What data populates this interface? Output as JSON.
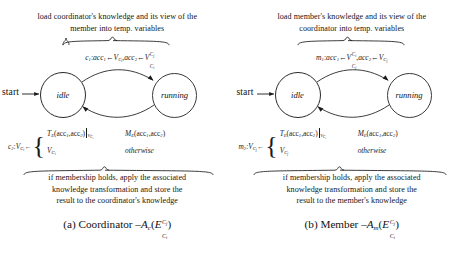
{
  "figure": {
    "type": "state-machine-diagram-pair",
    "panels": [
      {
        "id": "coordinator",
        "top_note_line1": "load coordinator's knowledge and its view of the",
        "top_note_line2": "member into temp. variables",
        "bottom_note_line1": "if membership holds, apply the associated",
        "bottom_note_line2": "knowledge transformation and store the",
        "bottom_note_line3": "result to the coordinator's knowledge",
        "start_label": "start",
        "states": [
          {
            "name": "idle",
            "emphasis": "thick"
          },
          {
            "name": "running",
            "emphasis": "thin"
          }
        ],
        "transition_forward": {
          "guard_name": "c",
          "guard_index": "1",
          "assign1_var": "acc",
          "assign1_sub": "1",
          "assign1_value_base": "V",
          "assign1_value_sub": "C",
          "assign1_value_subsub": "i",
          "assign2_var": "acc",
          "assign2_sub": "2",
          "assign2_value_base": "V",
          "assign2_value_sup": "C",
          "assign2_value_supsub": "j",
          "assign2_value_sub": "C",
          "assign2_value_subsub": "i"
        },
        "transition_back": {
          "guard_name": "c",
          "guard_index": "2",
          "target_base": "V",
          "target_sub": "C",
          "target_subsub": "i",
          "case1_fn": "T",
          "case1_fn_sub": "E",
          "case1_args": "(acc",
          "case1_arg1_sub": "1",
          "case1_args_mid": ",acc",
          "case1_arg2_sub": "2",
          "case1_args_end": ")",
          "case1_restrict_base": "V",
          "case1_restrict_sub": "C",
          "case1_restrict_subsub": "i",
          "case1_cond_fn": "M",
          "case1_cond_fn_sub": "E",
          "case1_cond_args": "(acc",
          "case1_cond_arg1_sub": "1",
          "case1_cond_args_mid": ",acc",
          "case1_cond_arg2_sub": "2",
          "case1_cond_args_end": ")",
          "case2_value_base": "V",
          "case2_value_sub": "C",
          "case2_value_subsub": "i",
          "case2_cond": "otherwise"
        },
        "caption_prefix": "(a) Coordinator",
        "caption_dash": "–",
        "caption_fn": "A",
        "caption_fn_sub": "c",
        "caption_open": "(",
        "caption_arg": "E",
        "caption_arg_sup": "C",
        "caption_arg_supsub": "j",
        "caption_arg_sub": "C",
        "caption_arg_subsub": "i",
        "caption_close": ")"
      },
      {
        "id": "member",
        "top_note_line1": "load member's knowledge and its view of the",
        "top_note_line2": "coordinator into temp. variables",
        "bottom_note_line1": "if membership holds, apply the associated",
        "bottom_note_line2": "knowledge transformation and store the",
        "bottom_note_line3": "result to the member's knowledge",
        "start_label": "start",
        "states": [
          {
            "name": "idle",
            "emphasis": "thick"
          },
          {
            "name": "running",
            "emphasis": "thin"
          }
        ],
        "transition_forward": {
          "guard_name": "m",
          "guard_index": "1",
          "assign1_var": "acc",
          "assign1_sub": "1",
          "assign1_value_base": "V",
          "assign1_value_sup": "C",
          "assign1_value_supsub": "i",
          "assign1_value_sub": "C",
          "assign1_value_subsub": "j",
          "assign2_var": "acc",
          "assign2_sub": "2",
          "assign2_value_base": "V",
          "assign2_value_sub": "C",
          "assign2_value_subsub": "j"
        },
        "transition_back": {
          "guard_name": "m",
          "guard_index": "2",
          "target_base": "V",
          "target_sub": "C",
          "target_subsub": "j",
          "case1_fn": "T",
          "case1_fn_sub": "E",
          "case1_args": "(acc",
          "case1_arg1_sub": "1",
          "case1_args_mid": ",acc",
          "case1_arg2_sub": "2",
          "case1_args_end": ")",
          "case1_restrict_base": "V",
          "case1_restrict_sub": "C",
          "case1_restrict_subsub": "j",
          "case1_cond_fn": "M",
          "case1_cond_fn_sub": "E",
          "case1_cond_args": "(acc",
          "case1_cond_arg1_sub": "1",
          "case1_cond_args_mid": ",acc",
          "case1_cond_arg2_sub": "2",
          "case1_cond_args_end": ")",
          "case2_value_base": "V",
          "case2_value_sub": "C",
          "case2_value_subsub": "j",
          "case2_cond": "otherwise"
        },
        "caption_prefix": "(b) Member",
        "caption_dash": "–",
        "caption_fn": "A",
        "caption_fn_sub": "m",
        "caption_open": "(",
        "caption_arg": "E",
        "caption_arg_sup": "C",
        "caption_arg_supsub": "j",
        "caption_arg_sub": "C",
        "caption_arg_subsub": "i",
        "caption_close": ")"
      }
    ],
    "colors": {
      "ink": "#1c1c1c",
      "background": "#ffffff",
      "state_stroke_thick": "#2a2a2a",
      "state_stroke_thin": "#3a3a3a"
    }
  }
}
